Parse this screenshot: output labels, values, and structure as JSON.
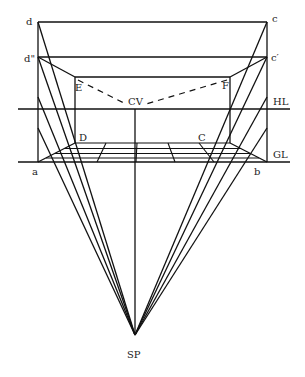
{
  "diagram": {
    "colors": {
      "line": "#111111",
      "label": "#222222",
      "background": "#ffffff"
    },
    "labels": {
      "d": "d",
      "d2": "d\"",
      "c": "c",
      "c2": "c′",
      "E": "E",
      "F": "F",
      "CV": "CV",
      "HL": "HL",
      "GL": "GL",
      "D": "D",
      "C": "C",
      "a": "a",
      "b": "b",
      "SP": "SP"
    },
    "points": {
      "d": [
        38,
        22
      ],
      "d2": [
        38,
        57
      ],
      "c": [
        267,
        22
      ],
      "c2": [
        267,
        57
      ],
      "E": [
        75,
        77
      ],
      "F": [
        230,
        77
      ],
      "CV": [
        135,
        108
      ],
      "D": [
        75,
        143
      ],
      "C": [
        230,
        143
      ],
      "a": [
        38,
        162
      ],
      "b": [
        267,
        162
      ],
      "SP": [
        135,
        335
      ]
    },
    "lines": {
      "horizon_line_y": 109,
      "ground_line_y": 162
    }
  }
}
